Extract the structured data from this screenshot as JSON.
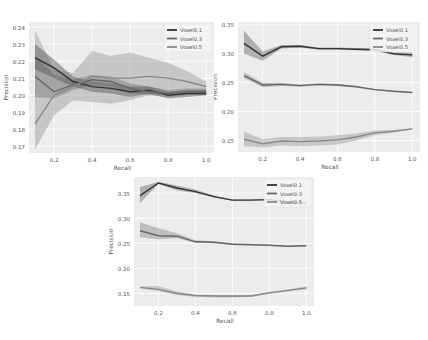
{
  "chart_data": [
    {
      "type": "line",
      "title": "",
      "xlabel": "Recall",
      "ylabel": "Precision",
      "x": [
        0.1,
        0.2,
        0.3,
        0.4,
        0.5,
        0.6,
        0.7,
        0.8,
        0.9,
        1.0
      ],
      "xticks": [
        "0.2",
        "0.4",
        "0.6",
        "0.8",
        "1.0"
      ],
      "yticks": [
        "0.17",
        "0.18",
        "0.19",
        "0.20",
        "0.21",
        "0.22",
        "0.23",
        "0.24"
      ],
      "ylim": [
        0.166,
        0.243
      ],
      "xlim": [
        0.1,
        1.02
      ],
      "grid": true,
      "legend_position": "upper right",
      "series": [
        {
          "name": "Voxel0.1",
          "color": "#333333",
          "band_color": "#555555",
          "values": [
            0.222,
            0.216,
            0.208,
            0.205,
            0.204,
            0.202,
            0.203,
            0.2,
            0.201,
            0.201
          ],
          "lower": [
            0.215,
            0.21,
            0.205,
            0.202,
            0.201,
            0.199,
            0.201,
            0.198,
            0.199,
            0.2
          ],
          "upper": [
            0.23,
            0.221,
            0.211,
            0.208,
            0.207,
            0.205,
            0.205,
            0.202,
            0.203,
            0.203
          ]
        },
        {
          "name": "Voxel0.3",
          "color": "#666666",
          "band_color": "#777777",
          "values": [
            0.211,
            0.202,
            0.206,
            0.209,
            0.208,
            0.204,
            0.202,
            0.201,
            0.202,
            0.202
          ],
          "lower": [
            0.199,
            0.198,
            0.203,
            0.206,
            0.205,
            0.201,
            0.2,
            0.199,
            0.2,
            0.2
          ],
          "upper": [
            0.223,
            0.212,
            0.209,
            0.212,
            0.211,
            0.207,
            0.205,
            0.203,
            0.204,
            0.204
          ]
        },
        {
          "name": "Voxel0.5",
          "color": "#888888",
          "band_color": "#999999",
          "values": [
            0.183,
            0.2,
            0.205,
            0.211,
            0.21,
            0.21,
            0.211,
            0.21,
            0.208,
            0.205
          ],
          "lower": [
            0.168,
            0.188,
            0.197,
            0.196,
            0.195,
            0.197,
            0.2,
            0.201,
            0.201,
            0.2
          ],
          "upper": [
            0.238,
            0.215,
            0.213,
            0.226,
            0.223,
            0.225,
            0.222,
            0.219,
            0.214,
            0.208
          ]
        }
      ]
    },
    {
      "type": "line",
      "title": "",
      "xlabel": "Recall",
      "ylabel": "Precision",
      "x": [
        0.1,
        0.2,
        0.3,
        0.4,
        0.5,
        0.6,
        0.7,
        0.8,
        0.9,
        1.0
      ],
      "xticks": [
        "0.2",
        "0.4",
        "0.6",
        "0.8",
        "1.0"
      ],
      "yticks": [
        "0.15",
        "0.20",
        "0.25",
        "0.30",
        "0.35"
      ],
      "ylim": [
        0.13,
        0.355
      ],
      "xlim": [
        0.1,
        1.02
      ],
      "grid": true,
      "legend_position": "upper right",
      "series": [
        {
          "name": "Voxel0.1",
          "color": "#333333",
          "band_color": "#666666",
          "values": [
            0.318,
            0.296,
            0.312,
            0.313,
            0.309,
            0.309,
            0.308,
            0.307,
            0.3,
            0.298
          ],
          "lower": [
            0.3,
            0.288,
            0.309,
            0.311,
            0.307,
            0.307,
            0.306,
            0.305,
            0.298,
            0.294
          ],
          "upper": [
            0.34,
            0.304,
            0.315,
            0.315,
            0.311,
            0.311,
            0.31,
            0.309,
            0.302,
            0.302
          ]
        },
        {
          "name": "Voxel0.3",
          "color": "#666666",
          "band_color": "#888888",
          "values": [
            0.262,
            0.246,
            0.247,
            0.245,
            0.247,
            0.246,
            0.243,
            0.238,
            0.235,
            0.233
          ],
          "lower": [
            0.258,
            0.242,
            0.244,
            0.243,
            0.245,
            0.244,
            0.242,
            0.237,
            0.234,
            0.232
          ],
          "upper": [
            0.268,
            0.25,
            0.25,
            0.247,
            0.249,
            0.248,
            0.244,
            0.239,
            0.236,
            0.234
          ]
        },
        {
          "name": "Voxel0.5",
          "color": "#888888",
          "band_color": "#999999",
          "values": [
            0.152,
            0.144,
            0.149,
            0.148,
            0.149,
            0.151,
            0.156,
            0.163,
            0.166,
            0.17
          ],
          "lower": [
            0.14,
            0.138,
            0.141,
            0.14,
            0.141,
            0.143,
            0.15,
            0.159,
            0.164,
            0.169
          ],
          "upper": [
            0.165,
            0.152,
            0.156,
            0.156,
            0.157,
            0.159,
            0.162,
            0.167,
            0.168,
            0.171
          ]
        }
      ]
    },
    {
      "type": "line",
      "title": "",
      "xlabel": "Recall",
      "ylabel": "Precision",
      "x": [
        0.1,
        0.2,
        0.3,
        0.4,
        0.5,
        0.6,
        0.7,
        0.8,
        0.9,
        1.0
      ],
      "xticks": [
        "0.2",
        "0.4",
        "0.6",
        "0.8",
        "1.0"
      ],
      "yticks": [
        "0.15",
        "0.20",
        "0.25",
        "0.30",
        "0.35"
      ],
      "ylim": [
        0.125,
        0.382
      ],
      "xlim": [
        0.1,
        1.02
      ],
      "grid": true,
      "legend_position": "upper right",
      "series": [
        {
          "name": "Voxel0.1",
          "color": "#333333",
          "band_color": "#666666",
          "values": [
            0.345,
            0.37,
            0.36,
            0.353,
            0.343,
            0.336,
            0.336,
            0.337,
            0.331,
            0.33
          ],
          "lower": [
            0.33,
            0.368,
            0.355,
            0.35,
            0.341,
            0.335,
            0.335,
            0.336,
            0.328,
            0.327
          ],
          "upper": [
            0.362,
            0.372,
            0.365,
            0.357,
            0.345,
            0.337,
            0.337,
            0.338,
            0.334,
            0.333
          ]
        },
        {
          "name": "Voxel0.3",
          "color": "#666666",
          "band_color": "#888888",
          "values": [
            0.275,
            0.265,
            0.264,
            0.253,
            0.252,
            0.248,
            0.247,
            0.246,
            0.244,
            0.245
          ],
          "lower": [
            0.262,
            0.258,
            0.26,
            0.251,
            0.25,
            0.247,
            0.246,
            0.245,
            0.243,
            0.244
          ],
          "upper": [
            0.292,
            0.28,
            0.27,
            0.256,
            0.254,
            0.25,
            0.249,
            0.247,
            0.245,
            0.246
          ]
        },
        {
          "name": "Voxel0.5",
          "color": "#888888",
          "band_color": "#999999",
          "values": [
            0.162,
            0.158,
            0.15,
            0.146,
            0.145,
            0.145,
            0.145,
            0.151,
            0.156,
            0.161
          ],
          "lower": [
            0.16,
            0.155,
            0.147,
            0.143,
            0.142,
            0.142,
            0.143,
            0.149,
            0.154,
            0.158
          ],
          "upper": [
            0.164,
            0.165,
            0.154,
            0.148,
            0.147,
            0.147,
            0.147,
            0.153,
            0.158,
            0.164
          ]
        }
      ]
    }
  ],
  "layout": [
    {
      "left": 0,
      "top": 0,
      "width": 214,
      "height": 172,
      "plot": {
        "x0": 35,
        "x1": 210,
        "y0": 22,
        "y1": 153
      }
    },
    {
      "left": 214,
      "top": 0,
      "width": 214,
      "height": 172,
      "plot": {
        "x0": 30,
        "x1": 202,
        "y0": 22,
        "y1": 152
      }
    },
    {
      "left": 100,
      "top": 170,
      "width": 228,
      "height": 170,
      "plot": {
        "x0": 40,
        "x1": 210,
        "y0": 7,
        "y1": 136
      }
    }
  ]
}
